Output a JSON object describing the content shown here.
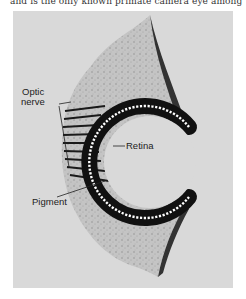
{
  "page": {
    "top_text": "and is the only known primate camera eye among"
  },
  "figure": {
    "labels": {
      "optic_nerve_line1": "Optic",
      "optic_nerve_line2": "nerve",
      "retina": "Retina",
      "pigment": "Pigment"
    },
    "colors": {
      "panel_background": "#d9d9d9",
      "tissue": "#bdbdbd",
      "cup_dark": "#111111",
      "retina_dots": "#ffffff"
    }
  }
}
